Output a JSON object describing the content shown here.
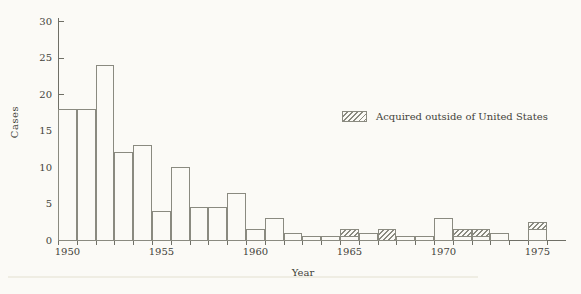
{
  "figure": {
    "background": "#fbfaf6",
    "line_color": "#8a8a80",
    "axis_color": "#6f6f66",
    "text_color": "#43433a"
  },
  "chart_data": {
    "type": "bar",
    "stacked": true,
    "title": "",
    "xlabel": "Year",
    "ylabel": "Cases",
    "ylim": [
      0,
      30
    ],
    "ytick_interval": 5,
    "y_ticks": [
      "0",
      "5",
      "10",
      "15",
      "20",
      "25",
      "30"
    ],
    "x_tick_years": [
      "1950",
      "1955",
      "1960",
      "1965",
      "1970",
      "1975"
    ],
    "grid": "off",
    "categories": [
      1950,
      1951,
      1952,
      1953,
      1954,
      1955,
      1956,
      1957,
      1958,
      1959,
      1960,
      1961,
      1962,
      1963,
      1964,
      1965,
      1966,
      1967,
      1968,
      1969,
      1970,
      1971,
      1972,
      1973,
      1974,
      1975
    ],
    "series": [
      {
        "name": "Acquired in United States",
        "style": "open",
        "values": [
          18,
          18,
          24,
          12,
          13,
          4,
          10,
          4.5,
          4.5,
          6.5,
          1.5,
          3,
          1,
          0.5,
          0.5,
          0.5,
          1,
          0,
          0.5,
          0.5,
          3,
          0.5,
          0.5,
          1,
          0,
          1.5
        ]
      },
      {
        "name": "Acquired outside of United States",
        "style": "hatched",
        "values": [
          0,
          0,
          0,
          0,
          0,
          0,
          0,
          0,
          0,
          0,
          0,
          0,
          0,
          0,
          0,
          1,
          0,
          1.5,
          0,
          0,
          0,
          1,
          1,
          0,
          0,
          1
        ]
      }
    ],
    "legend": {
      "position": "center-right",
      "entries": [
        {
          "label": "Acquired outside of United States",
          "style": "hatched"
        }
      ]
    }
  }
}
